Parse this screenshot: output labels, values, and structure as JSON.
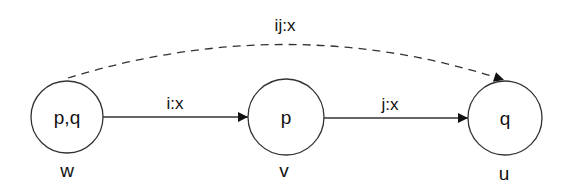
{
  "nodes": [
    {
      "id": "w",
      "content": "p,q",
      "label": "w"
    },
    {
      "id": "v",
      "content": "p",
      "label": "v"
    },
    {
      "id": "u",
      "content": "q",
      "label": "u"
    }
  ],
  "edges": [
    {
      "from": "w",
      "to": "v",
      "label": "i:x",
      "style": "solid"
    },
    {
      "from": "v",
      "to": "u",
      "label": "j:x",
      "style": "solid"
    },
    {
      "from": "w",
      "to": "u",
      "label": "ij:x",
      "style": "dashed"
    }
  ]
}
